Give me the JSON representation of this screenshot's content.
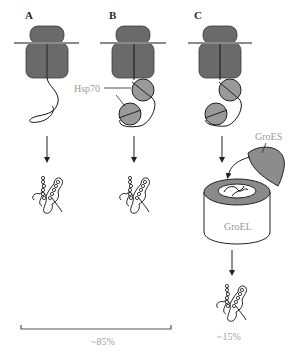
{
  "panels": [
    {
      "id": "A",
      "label": "A"
    },
    {
      "id": "B",
      "label": "B",
      "chaperone_label": "Hsp70"
    },
    {
      "id": "C",
      "label": "C",
      "cochaperone_label": "GroES",
      "chaperonin_label": "GroEL"
    }
  ],
  "yields": {
    "bracket_AB": "~85%",
    "panel_C": "~15%"
  },
  "colors": {
    "ribosome": "#6a6a6a",
    "hsp70": "#9a9a9a",
    "groes": "#8c8c8c",
    "groel_rim": "#8a8a8a",
    "label_gray": "#9a9a9a"
  }
}
